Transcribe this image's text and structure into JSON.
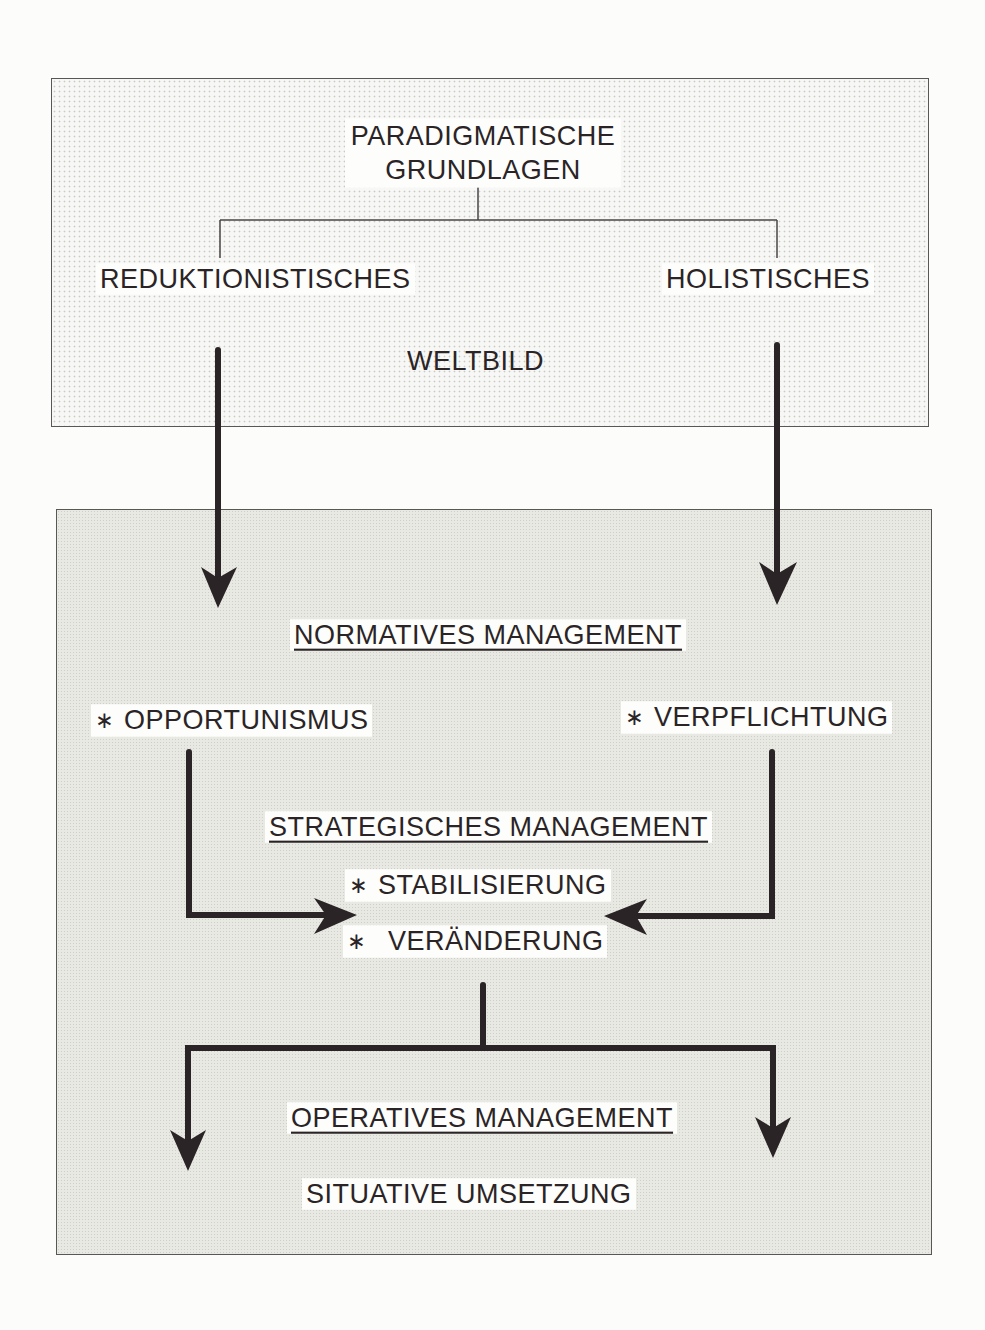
{
  "diagram": {
    "top_box": {
      "title_line1": "PARADIGMATISCHE",
      "title_line2": "GRUNDLAGEN",
      "left_branch": "REDUKTIONISTISCHES",
      "right_branch": "HOLISTISCHES",
      "footer": "WELTBILD"
    },
    "bottom_box": {
      "normative": {
        "heading": "NORMATIVES MANAGEMENT",
        "left_item": "OPPORTUNISMUS",
        "right_item": "VERPFLICHTUNG"
      },
      "strategic": {
        "heading": "STRATEGISCHES MANAGEMENT",
        "item1": "STABILISIERUNG",
        "item2": "VERÄNDERUNG"
      },
      "operative": {
        "heading": "OPERATIVES MANAGEMENT",
        "subheading": "SITUATIVE UMSETZUNG"
      }
    },
    "bullet_symbol": "∗",
    "colors": {
      "top_fill": "#f7f7f5",
      "bottom_fill": "#e9e9e4",
      "arrow": "#2a2426",
      "border": "#5a5658"
    }
  }
}
